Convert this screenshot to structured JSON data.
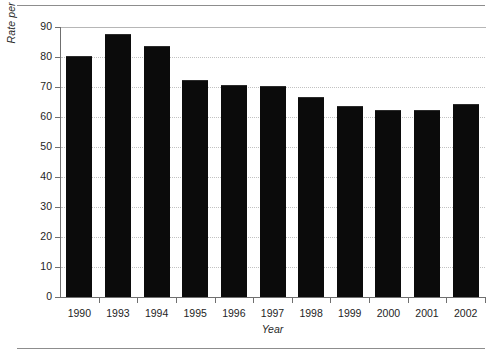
{
  "chart_data": {
    "type": "bar",
    "title": "",
    "xlabel": "Year",
    "ylabel": "Rate per 100,000 Females",
    "categories": [
      "1990",
      "1993",
      "1994",
      "1995",
      "1996",
      "1997",
      "1998",
      "1999",
      "2000",
      "2001",
      "2002"
    ],
    "values": [
      80.5,
      87.8,
      83.8,
      72.2,
      70.7,
      70.4,
      66.8,
      63.7,
      62.4,
      62.2,
      64.3
    ],
    "ylim": [
      0,
      90
    ],
    "yticks": [
      0,
      10,
      20,
      30,
      40,
      50,
      60,
      70,
      80,
      90
    ],
    "ytick_labels": [
      "0",
      "10",
      "20",
      "30",
      "40",
      "50",
      "60",
      "70",
      "80",
      "90"
    ],
    "grid": true,
    "grid_axis": "y",
    "legend": false,
    "legend_position": "none",
    "bar_color": "#0b0b0b",
    "gridline_color": "#c2c2c2",
    "axis_color": "#6f6f6f"
  }
}
